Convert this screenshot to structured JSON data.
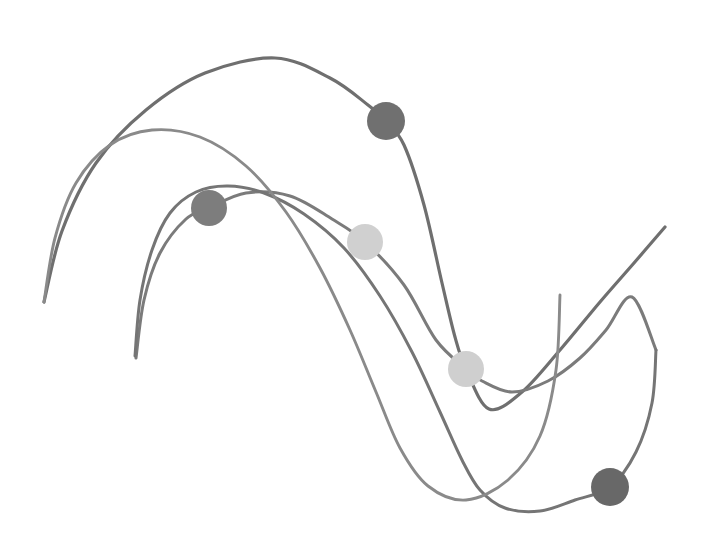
{
  "figure": {
    "name": "abstract-grayscale-curve-plot",
    "width": 710,
    "height": 552,
    "background_color": "#ffffff"
  },
  "chart_data": {
    "type": "line",
    "title": "",
    "subtitle": "",
    "xlabel": "",
    "ylabel": "",
    "xlim": [
      0,
      710
    ],
    "ylim": [
      552,
      0
    ],
    "grid": false,
    "axes_visible": false,
    "tick_labels_visible": false,
    "legend": false,
    "legend_position": "none",
    "coordinate_space": "pixel",
    "series": [
      {
        "name": "curve-1",
        "label": "",
        "color": "#6f6f6f",
        "line_width": 3.2,
        "opacity": 1.0,
        "smoothing": "cubic-spline",
        "points": [
          [
            44,
            302
          ],
          [
            62,
            231
          ],
          [
            96,
            163
          ],
          [
            146,
            110
          ],
          [
            205,
            73
          ],
          [
            275,
            58
          ],
          [
            330,
            78
          ],
          [
            368,
            105
          ],
          [
            386,
            121
          ],
          [
            404,
            145
          ],
          [
            424,
            205
          ],
          [
            442,
            283
          ],
          [
            455,
            337
          ],
          [
            466,
            369
          ],
          [
            489,
            409
          ],
          [
            522,
            392
          ],
          [
            560,
            350
          ],
          [
            600,
            302
          ],
          [
            634,
            263
          ],
          [
            665,
            227
          ]
        ]
      },
      {
        "name": "curve-2",
        "label": "",
        "color": "#7b7b7b",
        "line_width": 3.0,
        "opacity": 1.0,
        "smoothing": "cubic-spline",
        "points": [
          [
            136,
            358
          ],
          [
            144,
            300
          ],
          [
            160,
            253
          ],
          [
            186,
            219
          ],
          [
            209,
            208
          ],
          [
            246,
            193
          ],
          [
            290,
            196
          ],
          [
            332,
            219
          ],
          [
            365,
            242
          ],
          [
            404,
            285
          ],
          [
            436,
            340
          ],
          [
            466,
            369
          ],
          [
            482,
            381
          ],
          [
            512,
            392
          ],
          [
            548,
            381
          ],
          [
            580,
            358
          ],
          [
            606,
            330
          ],
          [
            632,
            297
          ],
          [
            656,
            350
          ]
        ]
      },
      {
        "name": "curve-3",
        "label": "",
        "color": "#757575",
        "line_width": 3.0,
        "opacity": 1.0,
        "smoothing": "cubic-spline",
        "points": [
          [
            135,
            356
          ],
          [
            140,
            300
          ],
          [
            152,
            250
          ],
          [
            170,
            213
          ],
          [
            196,
            192
          ],
          [
            228,
            186
          ],
          [
            264,
            193
          ],
          [
            304,
            214
          ],
          [
            344,
            248
          ],
          [
            380,
            296
          ],
          [
            412,
            352
          ],
          [
            440,
            412
          ],
          [
            462,
            460
          ],
          [
            480,
            490
          ],
          [
            505,
            508
          ],
          [
            540,
            511
          ],
          [
            575,
            500
          ],
          [
            610,
            487
          ],
          [
            636,
            452
          ],
          [
            652,
            403
          ],
          [
            656,
            350
          ]
        ]
      },
      {
        "name": "curve-4",
        "label": "",
        "color": "#8a8a8a",
        "line_width": 2.9,
        "opacity": 1.0,
        "smoothing": "cubic-spline",
        "points": [
          [
            44,
            302
          ],
          [
            55,
            238
          ],
          [
            76,
            183
          ],
          [
            110,
            145
          ],
          [
            152,
            130
          ],
          [
            200,
            137
          ],
          [
            246,
            166
          ],
          [
            286,
            212
          ],
          [
            320,
            268
          ],
          [
            350,
            330
          ],
          [
            376,
            392
          ],
          [
            400,
            448
          ],
          [
            428,
            486
          ],
          [
            466,
            500
          ],
          [
            508,
            480
          ],
          [
            540,
            436
          ],
          [
            556,
            370
          ],
          [
            560,
            295
          ]
        ]
      }
    ],
    "markers": [
      {
        "name": "marker-1",
        "label": "",
        "x": 386,
        "y": 121,
        "radius": 19,
        "color": "#707070",
        "on_series": "curve-1"
      },
      {
        "name": "marker-2",
        "label": "",
        "x": 209,
        "y": 208,
        "radius": 18,
        "color": "#7d7d7d",
        "on_series": "curve-2"
      },
      {
        "name": "marker-3",
        "label": "",
        "x": 365,
        "y": 242,
        "radius": 18,
        "color": "#d0d0d0",
        "on_series": "curve-2"
      },
      {
        "name": "marker-4",
        "label": "",
        "x": 466,
        "y": 369,
        "radius": 18,
        "color": "#cfcfcf",
        "on_series": "curve-1"
      },
      {
        "name": "marker-5",
        "label": "",
        "x": 610,
        "y": 487,
        "radius": 19,
        "color": "#686868",
        "on_series": "curve-3"
      }
    ]
  }
}
